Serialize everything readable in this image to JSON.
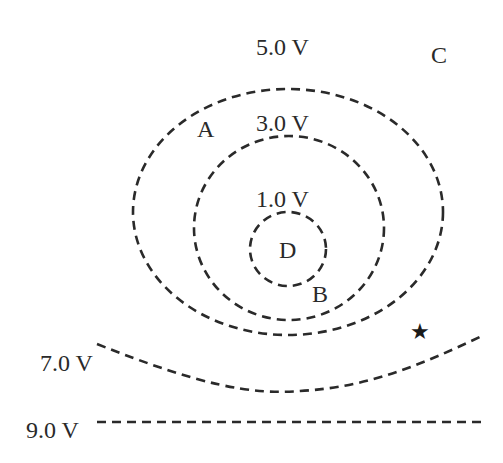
{
  "diagram": {
    "type": "equipotential-lines",
    "equipotentials": [
      {
        "label": "1.0 V",
        "shape": "closed-loop",
        "innermost": true
      },
      {
        "label": "3.0 V",
        "shape": "closed-loop"
      },
      {
        "label": "5.0 V",
        "shape": "closed-loop"
      },
      {
        "label": "7.0 V",
        "shape": "open-curve"
      },
      {
        "label": "9.0 V",
        "shape": "straight-line"
      }
    ],
    "points": [
      {
        "label": "A",
        "location": "between 3.0 V and 5.0 V, upper left"
      },
      {
        "label": "B",
        "location": "between 1.0 V and 3.0 V, lower right"
      },
      {
        "label": "C",
        "location": "outside 5.0 V, upper right"
      },
      {
        "label": "D",
        "location": "inside 1.0 V"
      }
    ],
    "marker": {
      "icon": "star-icon",
      "glyph": "★",
      "location": "between 5.0 V and 7.0 V, lower right"
    },
    "colors": {
      "line": "#2a2a2a",
      "background": "#ffffff"
    }
  }
}
